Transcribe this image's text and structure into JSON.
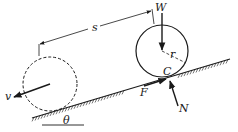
{
  "diagram": {
    "type": "physics-free-body",
    "labels": {
      "s": "s",
      "W": "W",
      "r": "r",
      "C": "C",
      "F": "F",
      "N": "N",
      "v": "v",
      "theta": "θ"
    },
    "elements": {
      "initial_position": "dashed circle (wheel at start)",
      "final_position": "solid circle (wheel after distance s)",
      "incline": "hatched inclined surface at angle θ"
    },
    "colors": {
      "ink": "#1a1a1a",
      "background": "#ffffff"
    }
  }
}
